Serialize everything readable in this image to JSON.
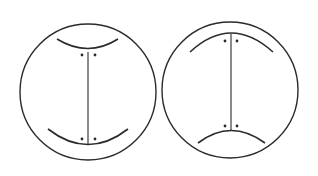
{
  "figure": {
    "stroke_color": "#2a2a2a",
    "background": "#ffffff",
    "panels": [
      {
        "id": "left",
        "description": "Circle with two upward-concave arcs, vertical spindle line with paired dots at both ends",
        "circle": {
          "cx": 88,
          "cy": 92,
          "r": 68
        },
        "top_arc": {
          "x1": 57,
          "y1": 39,
          "cx": 88,
          "cy": 58,
          "x2": 118,
          "y2": 39
        },
        "bottom_arc": {
          "x1": 48,
          "y1": 129,
          "cx": 88,
          "cy": 160,
          "x2": 128,
          "y2": 129
        },
        "line": {
          "x1": 88,
          "y1": 52,
          "x2": 88,
          "y2": 145
        },
        "dots": [
          {
            "x": 82,
            "y": 55
          },
          {
            "x": 95,
            "y": 55
          },
          {
            "x": 82,
            "y": 139
          },
          {
            "x": 95,
            "y": 139
          }
        ]
      },
      {
        "id": "right",
        "description": "Circle with two downward-concave (dome) arcs, vertical spindle line with paired dots at both ends",
        "circle": {
          "cx": 230,
          "cy": 90,
          "r": 68
        },
        "top_arc": {
          "x1": 190,
          "y1": 52,
          "cx": 231,
          "cy": 14,
          "x2": 273,
          "y2": 52
        },
        "bottom_arc": {
          "x1": 198,
          "y1": 143,
          "cx": 231,
          "cy": 118,
          "x2": 265,
          "y2": 143
        },
        "line": {
          "x1": 231,
          "y1": 34,
          "x2": 231,
          "y2": 130
        },
        "dots": [
          {
            "x": 225,
            "y": 41
          },
          {
            "x": 237,
            "y": 41
          },
          {
            "x": 225,
            "y": 126
          },
          {
            "x": 237,
            "y": 126
          }
        ]
      }
    ]
  }
}
